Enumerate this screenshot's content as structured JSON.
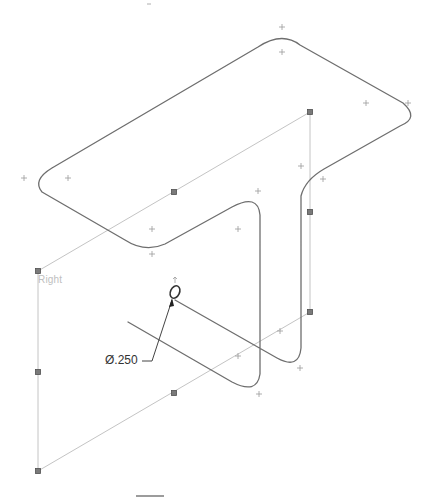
{
  "viewport": {
    "background": "#ffffff",
    "sketch_color": "#6e6e6e",
    "plane_color": "#c4c4c4",
    "handle_color": "#7a7a7a"
  },
  "plane": {
    "name": "Right",
    "label": "Right"
  },
  "dimension": {
    "type": "diameter",
    "symbol": "Ø",
    "value": ".250",
    "label": "Ø.250"
  },
  "sketch_entities": {
    "sweep_path": "T-shaped 3D sketch path with filleted corners",
    "profile": "circle",
    "centerline": "construction axis through profile"
  }
}
